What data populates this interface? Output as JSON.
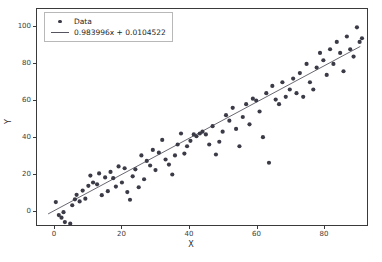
{
  "chart_data": {
    "type": "scatter",
    "title": "",
    "xlabel": "X",
    "ylabel": "Y",
    "xlim": [
      -5.3,
      93.0
    ],
    "ylim": [
      -8.0,
      110.0
    ],
    "grid": false,
    "xticks": [
      0,
      20,
      40,
      60,
      80
    ],
    "yticks": [
      0,
      20,
      40,
      60,
      80,
      100
    ],
    "xticklabels": [
      "0",
      "20",
      "40",
      "60",
      "80"
    ],
    "yticklabels": [
      "0",
      "20",
      "40",
      "60",
      "80",
      "100"
    ],
    "legend": {
      "position": "upper left",
      "entries": [
        {
          "label": "Data",
          "marker": "circle",
          "color": "#3b3b47"
        },
        {
          "label": "0.983996x + 0.0104522",
          "marker": "line",
          "color": "#55555f"
        }
      ]
    },
    "fit": {
      "slope": 0.983996,
      "intercept": 0.0104522,
      "label": "0.983996x + 0.0104522",
      "x_start": -2.0,
      "x_end": 91.0
    },
    "series": [
      {
        "name": "Data",
        "marker": "o",
        "color": "#3b3b47",
        "points": [
          [
            0.3,
            4.5
          ],
          [
            1.2,
            -2.6
          ],
          [
            2.0,
            -4.0
          ],
          [
            2.6,
            -1.0
          ],
          [
            3.0,
            -6.4
          ],
          [
            4.6,
            -7.2
          ],
          [
            5.2,
            2.8
          ],
          [
            6.0,
            6.0
          ],
          [
            6.5,
            8.5
          ],
          [
            7.4,
            4.9
          ],
          [
            8.3,
            10.8
          ],
          [
            9.1,
            6.4
          ],
          [
            10.0,
            13.4
          ],
          [
            10.6,
            19.0
          ],
          [
            11.4,
            15.2
          ],
          [
            12.6,
            14.2
          ],
          [
            13.2,
            20.2
          ],
          [
            14.0,
            8.3
          ],
          [
            15.0,
            18.0
          ],
          [
            15.8,
            10.5
          ],
          [
            16.6,
            21.0
          ],
          [
            17.4,
            17.6
          ],
          [
            18.2,
            13.0
          ],
          [
            19.0,
            24.0
          ],
          [
            20.0,
            15.2
          ],
          [
            20.8,
            23.0
          ],
          [
            21.6,
            10.0
          ],
          [
            22.4,
            5.8
          ],
          [
            23.2,
            18.6
          ],
          [
            24.0,
            22.4
          ],
          [
            25.0,
            12.6
          ],
          [
            25.8,
            30.0
          ],
          [
            26.6,
            17.0
          ],
          [
            27.4,
            27.0
          ],
          [
            28.4,
            24.5
          ],
          [
            29.2,
            33.0
          ],
          [
            30.0,
            22.0
          ],
          [
            31.0,
            31.5
          ],
          [
            32.0,
            38.5
          ],
          [
            33.0,
            27.8
          ],
          [
            34.0,
            25.0
          ],
          [
            35.0,
            19.6
          ],
          [
            35.8,
            30.0
          ],
          [
            36.6,
            36.0
          ],
          [
            37.6,
            42.0
          ],
          [
            38.6,
            31.0
          ],
          [
            39.4,
            35.0
          ],
          [
            40.4,
            38.0
          ],
          [
            41.4,
            41.5
          ],
          [
            42.2,
            40.5
          ],
          [
            43.2,
            42.0
          ],
          [
            44.0,
            43.0
          ],
          [
            45.0,
            41.5
          ],
          [
            46.0,
            36.0
          ],
          [
            47.0,
            46.0
          ],
          [
            48.0,
            30.5
          ],
          [
            49.0,
            37.5
          ],
          [
            50.0,
            43.0
          ],
          [
            51.0,
            52.0
          ],
          [
            52.0,
            49.0
          ],
          [
            53.0,
            56.0
          ],
          [
            54.0,
            44.5
          ],
          [
            55.0,
            35.0
          ],
          [
            56.0,
            51.0
          ],
          [
            57.0,
            58.0
          ],
          [
            58.0,
            47.0
          ],
          [
            59.0,
            61.0
          ],
          [
            60.0,
            60.0
          ],
          [
            61.0,
            54.0
          ],
          [
            62.0,
            40.0
          ],
          [
            63.0,
            64.0
          ],
          [
            63.8,
            26.0
          ],
          [
            64.8,
            68.0
          ],
          [
            65.8,
            60.5
          ],
          [
            66.8,
            58.0
          ],
          [
            67.8,
            70.0
          ],
          [
            68.8,
            62.0
          ],
          [
            70.0,
            66.0
          ],
          [
            71.0,
            72.0
          ],
          [
            72.0,
            64.0
          ],
          [
            73.0,
            75.0
          ],
          [
            74.0,
            62.0
          ],
          [
            75.0,
            80.0
          ],
          [
            76.0,
            70.0
          ],
          [
            77.0,
            66.0
          ],
          [
            78.0,
            78.0
          ],
          [
            79.0,
            86.0
          ],
          [
            80.0,
            82.0
          ],
          [
            81.0,
            74.0
          ],
          [
            82.0,
            88.0
          ],
          [
            83.0,
            80.0
          ],
          [
            84.0,
            92.0
          ],
          [
            85.0,
            86.0
          ],
          [
            86.0,
            76.0
          ],
          [
            87.0,
            95.0
          ],
          [
            88.0,
            88.0
          ],
          [
            89.0,
            84.0
          ],
          [
            90.0,
            100.0
          ],
          [
            90.8,
            92.0
          ],
          [
            91.5,
            94.0
          ]
        ]
      }
    ]
  }
}
